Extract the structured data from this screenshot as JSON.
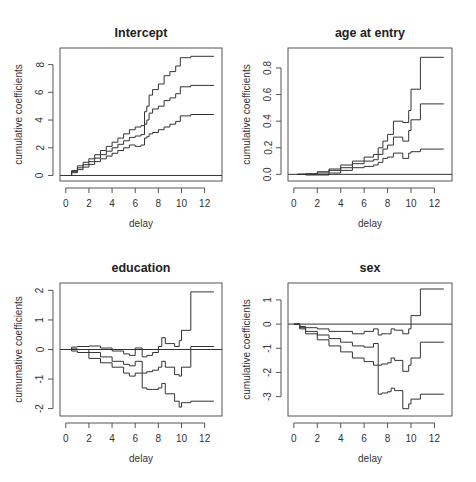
{
  "figure": {
    "background": "#ffffff",
    "line_color": "#333333",
    "box_color": "#555555"
  },
  "chart_data": [
    {
      "type": "line",
      "title": "Intercept",
      "xlabel": "delay",
      "ylabel": "cumulative coefficients",
      "xlim": [
        -0.5,
        13.5
      ],
      "ylim": [
        -0.4,
        9.2
      ],
      "xticks": [
        0,
        2,
        4,
        6,
        8,
        10,
        12
      ],
      "yticks": [
        0,
        2,
        4,
        6,
        8
      ],
      "reference_line": 0,
      "box": {
        "left": 60,
        "top": 48,
        "right": 222,
        "bottom": 181
      },
      "series": [
        {
          "name": "upper",
          "x": [
            0,
            0.5,
            1,
            1.5,
            2,
            2.5,
            3,
            3.5,
            4,
            4.5,
            5,
            5.5,
            6,
            6.5,
            6.8,
            7.0,
            7.2,
            7.5,
            8.0,
            8.5,
            9.0,
            9.5,
            9.9,
            10.8,
            12.8
          ],
          "y": [
            0,
            0.35,
            0.7,
            0.95,
            1.2,
            1.5,
            1.8,
            2.1,
            2.4,
            2.7,
            3.0,
            3.3,
            3.5,
            3.6,
            4.6,
            5.0,
            5.8,
            6.2,
            6.6,
            7.2,
            7.5,
            7.9,
            8.5,
            8.6,
            8.6
          ]
        },
        {
          "name": "estimate",
          "x": [
            0,
            0.5,
            1,
            1.5,
            2,
            2.5,
            3,
            3.5,
            4,
            4.5,
            5,
            5.5,
            6,
            6.5,
            6.8,
            7.0,
            7.2,
            7.5,
            8.0,
            8.5,
            9.0,
            9.5,
            9.9,
            10.8,
            12.8
          ],
          "y": [
            0,
            0.28,
            0.55,
            0.78,
            1.0,
            1.25,
            1.5,
            1.75,
            2.0,
            2.25,
            2.5,
            2.75,
            2.85,
            2.95,
            3.7,
            4.0,
            4.5,
            4.8,
            5.0,
            5.4,
            5.6,
            5.9,
            6.4,
            6.5,
            6.5
          ]
        },
        {
          "name": "lower",
          "x": [
            0,
            0.5,
            1,
            1.5,
            2,
            2.5,
            3,
            3.5,
            4,
            4.5,
            5,
            5.5,
            6,
            6.5,
            6.8,
            7.0,
            7.2,
            7.5,
            8.0,
            8.5,
            9.0,
            9.5,
            9.9,
            10.8,
            12.8
          ],
          "y": [
            0,
            0.2,
            0.42,
            0.6,
            0.8,
            1.0,
            1.2,
            1.4,
            1.6,
            1.8,
            2.0,
            2.2,
            2.1,
            2.2,
            2.7,
            2.8,
            3.0,
            3.1,
            3.3,
            3.5,
            3.7,
            3.9,
            4.3,
            4.4,
            4.4
          ]
        }
      ]
    },
    {
      "type": "line",
      "title": "age at entry",
      "xlabel": "delay",
      "ylabel": "cumulative coefficients",
      "xlim": [
        -0.5,
        13.5
      ],
      "ylim": [
        -0.05,
        0.95
      ],
      "xticks": [
        0,
        2,
        4,
        6,
        8,
        10,
        12
      ],
      "yticks": [
        0.0,
        0.2,
        0.4,
        0.6,
        0.8
      ],
      "ytick_labels": [
        "0.0",
        "0.2",
        "0.4",
        "0.6",
        "0.8"
      ],
      "reference_line": 0,
      "box": {
        "left": 288,
        "top": 48,
        "right": 452,
        "bottom": 181
      },
      "series": [
        {
          "name": "upper",
          "x": [
            0.3,
            1,
            2,
            3,
            4,
            5,
            6,
            6.8,
            7.2,
            7.6,
            8.0,
            8.5,
            9.3,
            9.8,
            10.0,
            10.8,
            12.8
          ],
          "y": [
            0,
            0.005,
            0.02,
            0.04,
            0.07,
            0.1,
            0.13,
            0.15,
            0.2,
            0.25,
            0.3,
            0.4,
            0.39,
            0.48,
            0.64,
            0.88,
            0.88
          ]
        },
        {
          "name": "estimate",
          "x": [
            0.3,
            1,
            2,
            3,
            4,
            5,
            6,
            6.8,
            7.2,
            7.6,
            8.0,
            8.5,
            9.3,
            9.8,
            10.0,
            10.8,
            12.8
          ],
          "y": [
            0,
            0.0,
            0.01,
            0.03,
            0.05,
            0.08,
            0.1,
            0.11,
            0.15,
            0.19,
            0.22,
            0.28,
            0.25,
            0.33,
            0.41,
            0.53,
            0.53
          ]
        },
        {
          "name": "lower",
          "x": [
            0.3,
            1,
            2,
            3,
            4,
            5,
            6,
            6.8,
            7.2,
            7.6,
            8.0,
            8.5,
            9.3,
            9.8,
            10.0,
            10.8,
            12.8
          ],
          "y": [
            0,
            -0.005,
            -0.005,
            0.01,
            0.03,
            0.05,
            0.06,
            0.07,
            0.09,
            0.12,
            0.13,
            0.16,
            0.12,
            0.16,
            0.17,
            0.19,
            0.19
          ]
        }
      ]
    },
    {
      "type": "line",
      "title": "education",
      "xlabel": "delay",
      "ylabel": "cumumative coefficients",
      "xlim": [
        -0.5,
        13.5
      ],
      "ylim": [
        -2.25,
        2.25
      ],
      "xticks": [
        0,
        2,
        4,
        6,
        8,
        10,
        12
      ],
      "yticks": [
        -2,
        -1,
        0,
        1,
        2
      ],
      "reference_line": 0,
      "box": {
        "left": 60,
        "top": 283,
        "right": 222,
        "bottom": 416
      },
      "series": [
        {
          "name": "upper",
          "x": [
            0,
            0.5,
            1,
            2,
            3,
            4,
            5,
            5.5,
            6,
            6.6,
            7.0,
            7.5,
            8.0,
            8.3,
            8.6,
            9.4,
            9.8,
            10.0,
            10.8,
            12.8
          ],
          "y": [
            0,
            0.08,
            0.1,
            0.12,
            0.05,
            -0.05,
            -0.15,
            -0.2,
            0.05,
            -0.25,
            -0.2,
            -0.1,
            0.1,
            0.4,
            0.2,
            0.1,
            0.3,
            0.65,
            1.95,
            1.95
          ]
        },
        {
          "name": "estimate",
          "x": [
            0,
            0.5,
            1,
            2,
            3,
            4,
            5,
            5.5,
            6,
            6.6,
            7.0,
            7.5,
            8.0,
            8.3,
            8.6,
            9.4,
            9.8,
            10.0,
            10.8,
            12.8
          ],
          "y": [
            0,
            0.02,
            0.0,
            -0.1,
            -0.25,
            -0.4,
            -0.5,
            -0.55,
            -0.4,
            -0.8,
            -0.75,
            -0.7,
            -0.6,
            -0.4,
            -0.6,
            -0.85,
            -0.9,
            -0.6,
            0.1,
            0.1
          ]
        },
        {
          "name": "lower",
          "x": [
            0,
            0.5,
            1,
            2,
            3,
            4,
            5,
            5.5,
            6,
            6.6,
            7.0,
            7.5,
            8.0,
            8.3,
            8.6,
            9.4,
            9.8,
            10.0,
            10.8,
            12.8
          ],
          "y": [
            0,
            -0.05,
            -0.1,
            -0.3,
            -0.45,
            -0.6,
            -0.8,
            -0.9,
            -0.8,
            -1.3,
            -1.35,
            -1.35,
            -1.3,
            -1.15,
            -1.5,
            -1.75,
            -1.95,
            -1.8,
            -1.75,
            -1.75
          ]
        }
      ]
    },
    {
      "type": "line",
      "title": "sex",
      "xlabel": "delay",
      "ylabel": "cumulative coefficients",
      "xlim": [
        -0.5,
        13.5
      ],
      "ylim": [
        -3.8,
        1.7
      ],
      "xticks": [
        0,
        2,
        4,
        6,
        8,
        10,
        12
      ],
      "yticks": [
        -3,
        -2,
        -1,
        0,
        1
      ],
      "reference_line": 0,
      "box": {
        "left": 288,
        "top": 283,
        "right": 452,
        "bottom": 416
      },
      "series": [
        {
          "name": "upper",
          "x": [
            0,
            0.5,
            1,
            2,
            3,
            4,
            5,
            6,
            6.8,
            7.2,
            7.5,
            8.0,
            8.3,
            8.6,
            9.3,
            9.8,
            10.0,
            10.8,
            12.8
          ],
          "y": [
            0,
            -0.1,
            -0.15,
            -0.2,
            -0.3,
            -0.3,
            -0.4,
            -0.3,
            -0.2,
            -0.45,
            -0.4,
            -0.4,
            -0.2,
            -0.25,
            -0.4,
            -0.2,
            0.35,
            1.45,
            1.45
          ]
        },
        {
          "name": "estimate",
          "x": [
            0,
            0.5,
            1,
            2,
            3,
            4,
            5,
            6,
            6.8,
            7.2,
            7.5,
            8.0,
            8.3,
            8.6,
            9.3,
            9.8,
            10.0,
            10.8,
            12.8
          ],
          "y": [
            0,
            -0.15,
            -0.3,
            -0.45,
            -0.6,
            -0.75,
            -0.9,
            -0.95,
            -0.8,
            -1.7,
            -1.65,
            -1.6,
            -1.4,
            -1.5,
            -1.95,
            -1.7,
            -1.4,
            -0.75,
            -0.75
          ]
        },
        {
          "name": "lower",
          "x": [
            0,
            0.5,
            1,
            2,
            3,
            4,
            5,
            6,
            6.8,
            7.2,
            7.5,
            8.0,
            8.3,
            8.6,
            9.3,
            9.8,
            10.0,
            10.8,
            12.8
          ],
          "y": [
            0,
            -0.2,
            -0.4,
            -0.65,
            -0.9,
            -1.15,
            -1.4,
            -1.55,
            -1.7,
            -2.9,
            -2.85,
            -2.8,
            -2.65,
            -2.75,
            -3.5,
            -3.3,
            -3.1,
            -2.9,
            -2.9
          ]
        }
      ]
    }
  ]
}
